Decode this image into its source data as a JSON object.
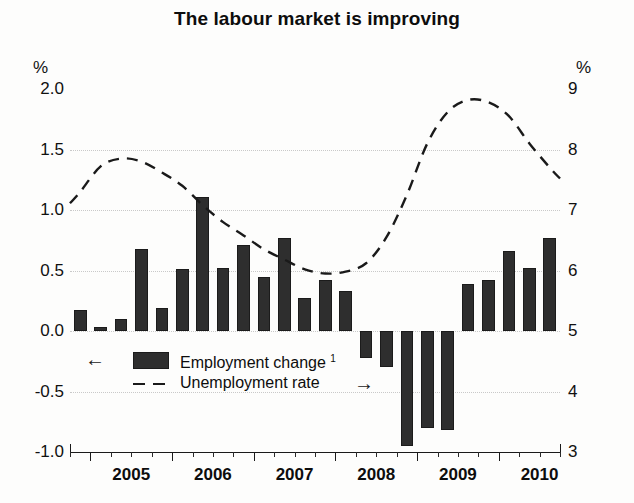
{
  "title": "The labour market is improving",
  "axis": {
    "left_unit": "%",
    "right_unit": "%",
    "left_ticks": [
      "2.0",
      "1.5",
      "1.0",
      "0.5",
      "0.0",
      "-0.5",
      "-1.0"
    ],
    "right_ticks": [
      "9",
      "8",
      "7",
      "6",
      "5",
      "4",
      "3"
    ],
    "x_labels": [
      "2005",
      "2006",
      "2007",
      "2008",
      "2009",
      "2010"
    ]
  },
  "legend": {
    "bars": {
      "label": "Employment change",
      "footnote": "1",
      "arrow": "←",
      "arrow_name": "left-arrow"
    },
    "line": {
      "label": "Unemployment rate",
      "arrow": "→",
      "arrow_name": "right-arrow"
    }
  },
  "chart_data": {
    "type": "bar",
    "title": "The labour market is improving",
    "xlabel": "",
    "ylabel": "%",
    "ylim": [
      -1.0,
      2.0
    ],
    "y2lim": [
      3,
      9
    ],
    "grid": true,
    "legend_position": "inside-lower-left",
    "x": [
      "2004Q4",
      "2005Q1",
      "2005Q2",
      "2005Q3",
      "2005Q4",
      "2006Q1",
      "2006Q2",
      "2006Q3",
      "2006Q4",
      "2007Q1",
      "2007Q2",
      "2007Q3",
      "2007Q4",
      "2008Q1",
      "2008Q2",
      "2008Q3",
      "2008Q4",
      "2009Q1",
      "2009Q2",
      "2009Q3",
      "2009Q4",
      "2010Q1",
      "2010Q2",
      "2010Q3"
    ],
    "series": [
      {
        "name": "Employment change",
        "type": "bar",
        "axis": "left",
        "unit": "%",
        "color": "#2e2e2e",
        "values": [
          0.17,
          0.03,
          0.1,
          0.68,
          0.19,
          0.51,
          1.11,
          0.52,
          0.71,
          0.45,
          0.77,
          0.27,
          0.42,
          0.33,
          -0.22,
          -0.3,
          -0.95,
          -0.8,
          -0.82,
          0.39,
          0.42,
          0.66,
          0.52,
          0.77
        ]
      },
      {
        "name": "Unemployment rate",
        "type": "line",
        "style": "dashed",
        "axis": "right",
        "unit": "%",
        "color": "#1a1a1a",
        "values": [
          7.3,
          7.72,
          7.85,
          7.8,
          7.62,
          7.4,
          7.08,
          6.8,
          6.58,
          6.35,
          6.18,
          6.02,
          5.95,
          5.98,
          6.12,
          6.55,
          7.25,
          8.1,
          8.62,
          8.82,
          8.78,
          8.55,
          8.1,
          7.7
        ]
      }
    ]
  }
}
